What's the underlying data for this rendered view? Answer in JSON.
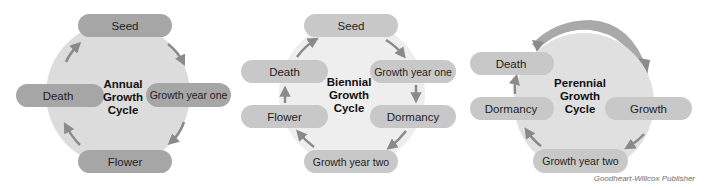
{
  "colors": {
    "circle_fill": "#dcdcdc",
    "pill_dark": "#a6a6a6",
    "pill_light": "#c8c8c8",
    "arrow": "#8a8a8a",
    "perennial_arc": "#a9a9a9",
    "text": "#1e1e1e"
  },
  "annual": {
    "title_lines": [
      "Annual",
      "Growth",
      "Cycle"
    ],
    "stages": {
      "seed": "Seed",
      "growth_year_one": "Growth year one",
      "flower": "Flower",
      "death": "Death"
    }
  },
  "biennial": {
    "title_lines": [
      "Biennial",
      "Growth",
      "Cycle"
    ],
    "stages": {
      "seed": "Seed",
      "growth_year_one": "Growth year one",
      "dormancy": "Dormancy",
      "growth_year_two": "Growth year two",
      "flower": "Flower",
      "death": "Death"
    }
  },
  "perennial": {
    "title_lines": [
      "Perennial",
      "Growth",
      "Cycle"
    ],
    "stages": {
      "growth": "Growth",
      "growth_year_two": "Growth year two",
      "dormancy": "Dormancy",
      "death": "Death"
    }
  },
  "credit": "Goodheart-Willcox Publisher"
}
